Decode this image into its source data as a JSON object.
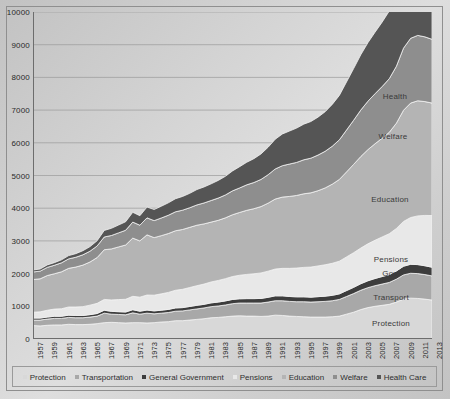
{
  "chart_data": {
    "type": "area",
    "stacked": true,
    "title": "",
    "xlabel": "",
    "ylabel": "",
    "ylim": [
      0,
      10000
    ],
    "ytick_step": 1000,
    "grid": true,
    "legend_position": "bottom",
    "yticks": [
      "0",
      "1000",
      "2000",
      "3000",
      "4000",
      "5000",
      "6000",
      "7000",
      "8000",
      "9000",
      "10000"
    ],
    "categories": [
      1957,
      1958,
      1959,
      1960,
      1961,
      1962,
      1963,
      1964,
      1965,
      1966,
      1967,
      1968,
      1969,
      1970,
      1971,
      1972,
      1973,
      1974,
      1975,
      1976,
      1977,
      1978,
      1979,
      1980,
      1981,
      1982,
      1983,
      1984,
      1985,
      1986,
      1987,
      1988,
      1989,
      1990,
      1991,
      1992,
      1993,
      1994,
      1995,
      1996,
      1997,
      1998,
      1999,
      2000,
      2001,
      2002,
      2003,
      2004,
      2005,
      2006,
      2007,
      2008,
      2009,
      2010,
      2011,
      2012,
      2013
    ],
    "xtick_labels": [
      "1957",
      "1959",
      "1961",
      "1963",
      "1965",
      "1967",
      "1969",
      "1971",
      "1973",
      "1975",
      "1977",
      "1979",
      "1981",
      "1983",
      "1985",
      "1987",
      "1989",
      "1991",
      "1993",
      "1995",
      "1997",
      "1999",
      "2001",
      "2003",
      "2005",
      "2007",
      "2009",
      "2011",
      "2013"
    ],
    "series": [
      {
        "name": "Protection",
        "color": "#d8d8d8",
        "inline_label": "Protection",
        "values": [
          410,
          400,
          420,
          430,
          430,
          450,
          440,
          440,
          450,
          470,
          500,
          510,
          500,
          490,
          500,
          500,
          490,
          500,
          520,
          530,
          560,
          560,
          580,
          600,
          620,
          650,
          660,
          680,
          700,
          710,
          700,
          700,
          690,
          700,
          730,
          720,
          700,
          690,
          680,
          670,
          670,
          670,
          680,
          700,
          760,
          820,
          900,
          960,
          1000,
          1030,
          1060,
          1130,
          1220,
          1250,
          1240,
          1220,
          1190
        ]
      },
      {
        "name": "Transportation",
        "color": "#a8a8a8",
        "inline_label": "Transport",
        "values": [
          170,
          180,
          190,
          200,
          200,
          210,
          210,
          210,
          220,
          230,
          290,
          250,
          250,
          250,
          300,
          260,
          300,
          270,
          270,
          280,
          290,
          300,
          310,
          320,
          330,
          340,
          350,
          360,
          380,
          390,
          400,
          400,
          410,
          430,
          440,
          450,
          450,
          450,
          460,
          460,
          470,
          480,
          490,
          510,
          540,
          570,
          590,
          610,
          630,
          650,
          670,
          700,
          740,
          760,
          760,
          750,
          740
        ]
      },
      {
        "name": "General Government",
        "color": "#3d3d3d",
        "inline_label": "Gov",
        "values": [
          60,
          60,
          60,
          65,
          65,
          70,
          70,
          70,
          75,
          80,
          90,
          85,
          85,
          85,
          95,
          90,
          95,
          90,
          90,
          95,
          100,
          100,
          105,
          110,
          110,
          115,
          120,
          125,
          130,
          130,
          135,
          135,
          140,
          145,
          150,
          150,
          150,
          150,
          150,
          150,
          155,
          160,
          165,
          170,
          180,
          190,
          200,
          210,
          220,
          230,
          240,
          250,
          265,
          275,
          275,
          270,
          265
        ]
      },
      {
        "name": "Pensions",
        "color": "#e8e8e8",
        "inline_label": "Pensions",
        "values": [
          180,
          190,
          210,
          220,
          230,
          250,
          260,
          270,
          290,
          310,
          330,
          350,
          370,
          390,
          410,
          430,
          460,
          480,
          500,
          520,
          540,
          560,
          580,
          600,
          620,
          640,
          660,
          680,
          700,
          720,
          740,
          760,
          780,
          800,
          820,
          840,
          860,
          880,
          900,
          920,
          940,
          960,
          980,
          1000,
          1030,
          1060,
          1090,
          1130,
          1170,
          1210,
          1250,
          1300,
          1370,
          1430,
          1490,
          1540,
          1580
        ]
      },
      {
        "name": "Education",
        "color": "#b4b4b4",
        "inline_label": "Education",
        "values": [
          1000,
          1010,
          1060,
          1080,
          1130,
          1180,
          1220,
          1270,
          1320,
          1400,
          1520,
          1560,
          1610,
          1660,
          1780,
          1720,
          1840,
          1760,
          1780,
          1800,
          1820,
          1830,
          1840,
          1850,
          1840,
          1830,
          1840,
          1860,
          1890,
          1920,
          1960,
          1990,
          2030,
          2080,
          2140,
          2180,
          2200,
          2220,
          2250,
          2270,
          2300,
          2350,
          2420,
          2500,
          2600,
          2700,
          2800,
          2880,
          2950,
          3020,
          3100,
          3220,
          3400,
          3500,
          3520,
          3480,
          3440
        ]
      },
      {
        "name": "Welfare",
        "color": "#8e8e8e",
        "inline_label": "Welfare",
        "values": [
          230,
          235,
          250,
          260,
          275,
          290,
          300,
          315,
          330,
          355,
          390,
          410,
          430,
          450,
          490,
          480,
          520,
          520,
          540,
          560,
          580,
          590,
          600,
          620,
          640,
          660,
          680,
          700,
          730,
          750,
          780,
          800,
          830,
          870,
          920,
          960,
          990,
          1010,
          1040,
          1060,
          1090,
          1120,
          1160,
          1210,
          1280,
          1350,
          1420,
          1480,
          1530,
          1580,
          1640,
          1740,
          1900,
          1980,
          2000,
          1980,
          1950
        ]
      },
      {
        "name": "Health Care",
        "color": "#555555",
        "inline_label": "Health",
        "values": [
          60,
          65,
          75,
          80,
          90,
          100,
          110,
          125,
          140,
          160,
          200,
          220,
          240,
          260,
          300,
          290,
          330,
          340,
          360,
          380,
          400,
          420,
          440,
          470,
          490,
          510,
          540,
          570,
          610,
          650,
          690,
          730,
          780,
          840,
          910,
          970,
          1010,
          1050,
          1090,
          1120,
          1160,
          1210,
          1280,
          1360,
          1470,
          1580,
          1690,
          1790,
          1880,
          1970,
          2070,
          2240,
          2520,
          2650,
          2690,
          2670,
          2640
        ]
      }
    ],
    "inline_labels": [
      {
        "text": "Health",
        "x": 395,
        "y": 96
      },
      {
        "text": "Welfare",
        "x": 393,
        "y": 136
      },
      {
        "text": "Education",
        "x": 390,
        "y": 199
      },
      {
        "text": "Pensions",
        "x": 391,
        "y": 259
      },
      {
        "text": "Gov",
        "x": 390,
        "y": 273
      },
      {
        "text": "Transport",
        "x": 391,
        "y": 297
      },
      {
        "text": "Protection",
        "x": 391,
        "y": 323
      }
    ],
    "legend": [
      {
        "label": "Protection",
        "color": "#d8d8d8"
      },
      {
        "label": "Transportation",
        "color": "#a8a8a8"
      },
      {
        "label": "General Government",
        "color": "#3d3d3d"
      },
      {
        "label": "Pensions",
        "color": "#e8e8e8"
      },
      {
        "label": "Education",
        "color": "#b4b4b4"
      },
      {
        "label": "Welfare",
        "color": "#8e8e8e"
      },
      {
        "label": "Health Care",
        "color": "#555555"
      }
    ]
  }
}
